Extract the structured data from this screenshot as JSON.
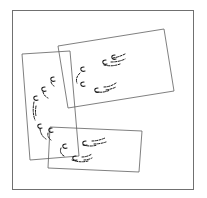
{
  "diagram": {
    "colors": {
      "background": "#ffffff",
      "frame_stroke": "#707070",
      "rect_stroke": "#606060",
      "glyph_stroke": "#1a1a1a"
    },
    "frame": {
      "x1": 12,
      "y1": 10,
      "x2": 193,
      "y2": 189
    },
    "rectangles": [
      {
        "id": "top-right",
        "corners": [
          [
            58,
            46
          ],
          [
            164,
            29
          ],
          [
            174,
            91
          ],
          [
            68,
            108
          ]
        ]
      },
      {
        "id": "left",
        "corners": [
          [
            22,
            54
          ],
          [
            70,
            51
          ],
          [
            79,
            156
          ],
          [
            30,
            160
          ]
        ]
      },
      {
        "id": "bottom",
        "corners": [
          [
            50,
            127
          ],
          [
            142,
            131
          ],
          [
            139,
            172
          ],
          [
            48,
            168
          ]
        ]
      }
    ],
    "glyph_clusters": [
      {
        "id": "top-right-cluster",
        "rect": "top-right",
        "glyph_count": 6
      },
      {
        "id": "left-cluster",
        "rect": "left",
        "glyph_count": 6
      },
      {
        "id": "bottom-cluster",
        "rect": "bottom",
        "glyph_count": 6
      }
    ]
  }
}
